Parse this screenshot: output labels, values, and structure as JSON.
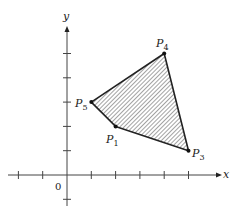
{
  "diagram": {
    "type": "coordinate-plane-polygon",
    "axes": {
      "x_label": "x",
      "y_label": "y",
      "origin_label": "0",
      "x_ticks": [
        -2,
        -1,
        1,
        2,
        3,
        4,
        5
      ],
      "y_ticks": [
        -1,
        1,
        2,
        3,
        4,
        5
      ]
    },
    "points": [
      {
        "id": "P1",
        "name": "P",
        "sub": "1",
        "x": 2,
        "y": 2
      },
      {
        "id": "P3",
        "name": "P",
        "sub": "3",
        "x": 5,
        "y": 1
      },
      {
        "id": "P4",
        "name": "P",
        "sub": "4",
        "x": 4,
        "y": 5
      },
      {
        "id": "P5",
        "name": "P",
        "sub": "5",
        "x": 1,
        "y": 3
      }
    ],
    "polygon_order": [
      "P1",
      "P3",
      "P4",
      "P5"
    ],
    "fill": "hatched",
    "colors": {
      "stroke": "#222222",
      "hatch": "#555555",
      "axis": "#444444"
    }
  }
}
